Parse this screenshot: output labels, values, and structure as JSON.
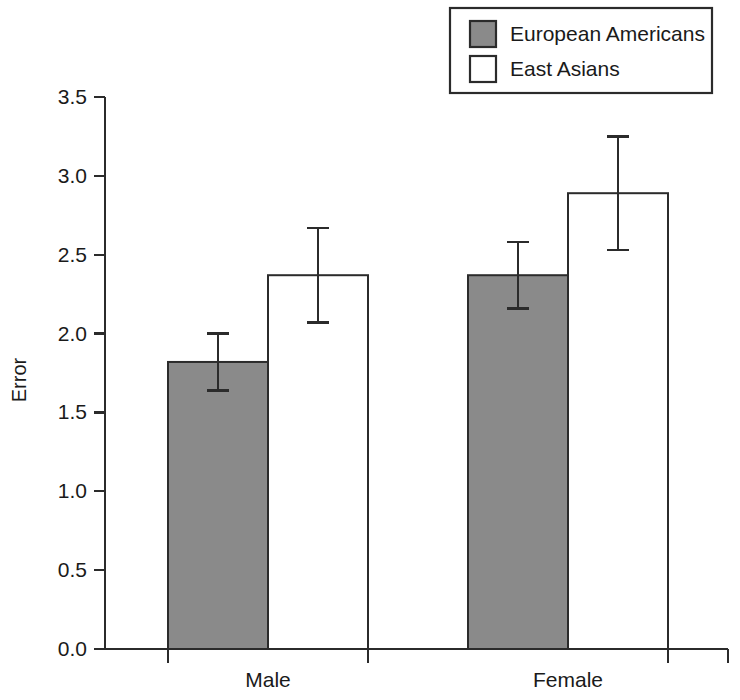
{
  "chart_data": {
    "type": "bar",
    "title": "",
    "xlabel": "",
    "ylabel": "Error",
    "categories": [
      "Male",
      "Female"
    ],
    "ylim": [
      0.0,
      3.5
    ],
    "ytick_labels": [
      "0.0",
      "0.5",
      "1.0",
      "1.5",
      "2.0",
      "2.5",
      "3.0",
      "3.5"
    ],
    "ytick_values": [
      0.0,
      0.5,
      1.0,
      1.5,
      2.0,
      2.5,
      3.0,
      3.5
    ],
    "grid": false,
    "legend_position": "top-right",
    "error_type": "error-bars",
    "series": [
      {
        "name": "European Americans",
        "color": "#8a8a8a",
        "values": [
          1.82,
          2.37
        ],
        "errors": [
          0.18,
          0.21
        ]
      },
      {
        "name": "East Asians",
        "color": "#ffffff",
        "values": [
          2.37,
          2.89
        ],
        "errors": [
          0.3,
          0.36
        ]
      }
    ]
  },
  "legend": {
    "items": [
      {
        "label": "European Americans",
        "swatch": "#8a8a8a"
      },
      {
        "label": "East Asians",
        "swatch": "#ffffff"
      }
    ]
  },
  "axes": {
    "y_title": "Error",
    "y_ticks": [
      "3.5",
      "3.0",
      "2.5",
      "2.0",
      "1.5",
      "1.0",
      "0.5",
      "0.0"
    ],
    "x_ticks": [
      "Male",
      "Female"
    ]
  },
  "colors": {
    "series_fill": "#8a8a8a",
    "series_alt_fill": "#ffffff",
    "axis": "#2b2b2b",
    "text": "#1a1a1a",
    "background": "#ffffff"
  }
}
